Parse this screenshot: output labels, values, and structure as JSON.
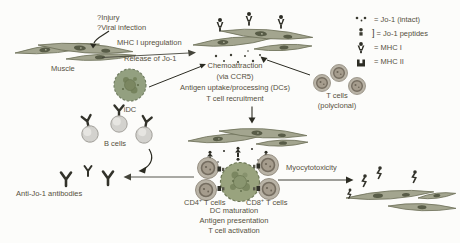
{
  "colors": {
    "text": "#56503e",
    "muscle_fill": "#a3a58f",
    "muscle_stroke": "#6c6f57",
    "nucleus": "#585c47",
    "dark_icon": "#2d2d25",
    "tcell_outer": "#b9b3a6",
    "tcell_ring": "#756d60",
    "dc_fill": "#99a37e",
    "bcell_fill": "#d3d2ce",
    "arrow": "#2b2b22"
  },
  "annotations": {
    "trigger": {
      "line1": "?Injury",
      "line2": "?Viral infection"
    },
    "mhc_upregulation": "MHC I upregulation",
    "release_jo1": "Release of Jo-1",
    "chemoattraction": {
      "line1": "Chemoattraction",
      "line2": "(via CCR5)"
    },
    "uptake": {
      "line1": "Antigen uptake/processing (DCs)",
      "line2": "T cell recruitment"
    },
    "myocytotoxicity": "Myocytotoxicity",
    "activation": {
      "line1": "DC maturation",
      "line2": "Antigen presentation",
      "line3": "T cell activation"
    }
  },
  "cells": {
    "muscle": "Muscle",
    "idc": "iDC",
    "tcells_polyclonal": {
      "line1": "T cells",
      "line2": "(polyclonal)"
    },
    "bcells": "B cells",
    "antibodies": "Anti-Jo-1 antibodies",
    "cd4": {
      "base": "CD4",
      "sup": "+",
      "rest": " T cells"
    },
    "cd8": {
      "base": "CD8",
      "sup": "+",
      "rest": " T cells"
    }
  },
  "legend": {
    "items": [
      {
        "icon": "jo1-intact-icon",
        "label": "= Jo-1 (intact)"
      },
      {
        "icon": "jo1-peptides-icon",
        "bracket": "]",
        "label": "= Jo-1 peptides"
      },
      {
        "icon": "mhc-i-icon",
        "label": "= MHC I"
      },
      {
        "icon": "mhc-ii-icon",
        "label": "= MHC II"
      }
    ]
  }
}
